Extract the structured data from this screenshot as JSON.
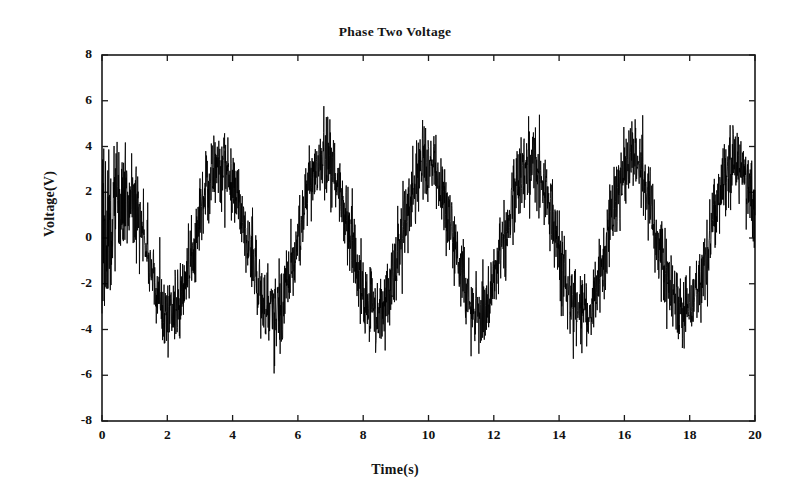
{
  "chart_data": {
    "type": "line",
    "title": "Phase Two Voltage",
    "xlabel": "Time(s)",
    "ylabel": "Voltage(V)",
    "xlim": [
      0,
      20
    ],
    "ylim": [
      -8,
      8
    ],
    "grid": false,
    "legend": null,
    "xticks": [
      0,
      2,
      4,
      6,
      8,
      10,
      12,
      14,
      16,
      18,
      20
    ],
    "xtick_labels": [
      "0",
      "2",
      "4",
      "6",
      "8",
      "10",
      "12",
      "14",
      "16",
      "18",
      "20"
    ],
    "yticks": [
      8,
      6,
      4,
      2,
      0,
      -2,
      -4,
      -6,
      -8
    ],
    "ytick_labels": [
      "8",
      "6",
      "4",
      "2",
      "0",
      "-2",
      "-4",
      "-6",
      "-8"
    ],
    "series": [
      {
        "name": "Phase Two Voltage",
        "color": "#000000",
        "description": "Noisy sinusoidal voltage waveform with additive random noise",
        "signal_amplitude": 3.3,
        "signal_period_s": 3.15,
        "signal_frequency_hz": 0.317,
        "signal_phase_rad": 0.55,
        "signal_mean": 0.0,
        "noise_amplitude": 1.45,
        "noise_spike_amplitude": 2.2,
        "sample_count": 2600,
        "observed_max": 6.5,
        "observed_min": -7.2,
        "peak_times": [
          2.4,
          5.5,
          8.7,
          11.8,
          15.0,
          18.1
        ],
        "peak_values": [
          5.9,
          6.5,
          6.1,
          6.4,
          6.4,
          5.6
        ],
        "trough_times": [
          3.9,
          7.0,
          10.3,
          13.4,
          16.5,
          19.6
        ],
        "trough_values": [
          -5.3,
          -7.2,
          -5.7,
          -7.1,
          -5.2,
          -5.8
        ],
        "startup_burst": {
          "t_start": 0.0,
          "t_end": 1.3,
          "min": -4.1,
          "max": 4.2,
          "note": "dense high-density noise band at record start"
        }
      }
    ]
  },
  "axes": {
    "box_color": "#1a1a1a",
    "box_line_width": 1.6,
    "tick_direction": "in",
    "tick_length_major": 6,
    "tick_length_minor": 3,
    "background": "#ffffff"
  },
  "figure": {
    "width": 790,
    "height": 504,
    "background": "#ffffff",
    "plot_left": 102,
    "plot_right": 755,
    "plot_top": 55,
    "plot_bottom": 421
  }
}
